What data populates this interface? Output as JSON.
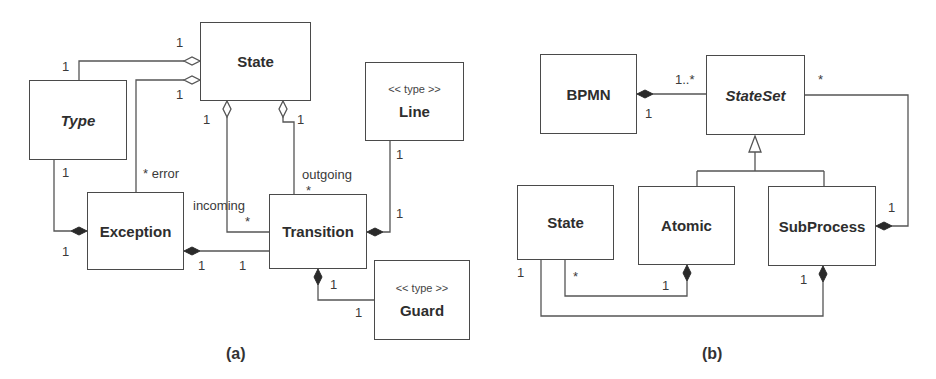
{
  "diagram_a": {
    "caption": "(a)",
    "classes": {
      "state": {
        "name": "State"
      },
      "type": {
        "name": "Type"
      },
      "exception": {
        "name": "Exception"
      },
      "transition": {
        "name": "Transition"
      },
      "line": {
        "name": "Line",
        "stereotype": "<< type >>"
      },
      "guard": {
        "name": "Guard",
        "stereotype": "<< type >>"
      }
    },
    "labels": {
      "type_state_state_end": "1",
      "type_state_type_end": "1",
      "exc_state_state_end": "1",
      "exc_state_exc_end": "* error",
      "incoming_state_end": "1",
      "incoming_role": "incoming",
      "incoming_mult": "*",
      "outgoing_state_end": "1",
      "outgoing_role": "outgoing",
      "outgoing_mult": "*",
      "type_exc_type_end": "1",
      "type_exc_exc_end": "1",
      "exc_trans_exc_end": "1",
      "exc_trans_trans_end": "1",
      "line_trans_line_end": "1",
      "line_trans_trans_end": "1",
      "guard_trans_trans_end": "1",
      "guard_trans_guard_end": "1"
    }
  },
  "diagram_b": {
    "caption": "(b)",
    "classes": {
      "bpmn": {
        "name": "BPMN"
      },
      "stateset": {
        "name": "StateSet"
      },
      "state": {
        "name": "State"
      },
      "atomic": {
        "name": "Atomic"
      },
      "subprocess": {
        "name": "SubProcess"
      }
    },
    "labels": {
      "bpmn_stateset_many": "1..*",
      "bpmn_stateset_one": "1",
      "stateset_sub_many": "*",
      "stateset_sub_one": "1",
      "state_atomic_state_end": "*",
      "state_atomic_atomic_end": "1",
      "state_sub_state_end": "1",
      "state_sub_sub_end": "1"
    }
  }
}
